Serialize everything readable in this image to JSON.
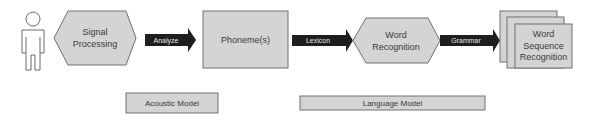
{
  "diagram": {
    "actor": {
      "icon": "person-icon"
    },
    "nodes": {
      "signal_processing": {
        "line1": "Signal",
        "line2": "Processing",
        "shape": "hexagon"
      },
      "phonemes": {
        "label": "Phoneme(s)",
        "shape": "rectangle"
      },
      "word_recognition": {
        "line1": "Word",
        "line2": "Recognition",
        "shape": "hexagon"
      },
      "word_sequence_recognition": {
        "line1": "Word",
        "line2": "Sequence",
        "line3": "Recognition",
        "shape": "stacked-rectangles"
      }
    },
    "edges": {
      "analyze": {
        "label": "Analyze",
        "from": "signal_processing",
        "to": "phonemes"
      },
      "lexicon": {
        "label": "Lexicon",
        "from": "phonemes",
        "to": "word_recognition"
      },
      "grammar": {
        "label": "Grammar",
        "from": "word_recognition",
        "to": "word_sequence_recognition"
      }
    },
    "groups": {
      "acoustic_model": {
        "label": "Acoustic Model"
      },
      "language_model": {
        "label": "Language Model"
      }
    },
    "colors": {
      "node_fill": "#d4d4d4",
      "node_stroke": "#707070",
      "arrow_fill": "#1e1e1e",
      "arrow_text": "#e8e8e8",
      "text": "#3a3a3a",
      "actor_stroke": "#6a6a6a"
    }
  }
}
